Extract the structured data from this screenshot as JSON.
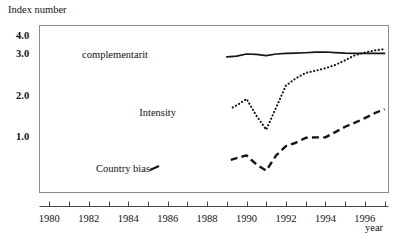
{
  "chart_data": {
    "type": "line",
    "title": "",
    "xlabel": "year",
    "ylabel": "Index number",
    "xlim": [
      1979.5,
      1997.2
    ],
    "ylim": [
      0.0,
      4.4
    ],
    "grid": false,
    "legend": "inline-annotations",
    "y_ticks": [
      "4.0",
      "3.0",
      "2.0",
      "1.0"
    ],
    "y_tick_values": [
      4.0,
      3.0,
      2.0,
      1.0
    ],
    "x_ticks": [
      "1980",
      "1982",
      "1984",
      "1986",
      "1988",
      "1990",
      "1992",
      "1994",
      "1996"
    ],
    "x_tick_values": [
      1980,
      1982,
      1984,
      1986,
      1988,
      1990,
      1992,
      1994,
      1996
    ],
    "x_minor_ticks": [
      1980,
      1981,
      1982,
      1983,
      1984,
      1985,
      1986,
      1987,
      1988,
      1989,
      1990,
      1991,
      1992,
      1993,
      1994,
      1995,
      1996,
      1997
    ],
    "series": [
      {
        "name": "complementarit",
        "style": "solid",
        "color": "#161616",
        "x": [
          1989.0,
          1989.5,
          1990.0,
          1990.5,
          1991.0,
          1991.5,
          1992.0,
          1992.5,
          1993.0,
          1993.5,
          1994.0,
          1994.5,
          1995.0,
          1995.5,
          1996.0,
          1996.5,
          1997.0
        ],
        "values": [
          2.93,
          2.95,
          3.0,
          2.99,
          2.96,
          3.0,
          3.03,
          3.05,
          3.07,
          3.1,
          3.11,
          3.08,
          3.05,
          3.04,
          3.03,
          3.03,
          3.03
        ]
      },
      {
        "name": "Intensity",
        "style": "dotted",
        "color": "#161616",
        "x": [
          1989.3,
          1989.6,
          1990.0,
          1990.5,
          1991.0,
          1991.5,
          1992.0,
          1992.5,
          1993.0,
          1993.5,
          1994.0,
          1994.5,
          1995.0,
          1995.5,
          1996.0,
          1996.5,
          1997.0
        ],
        "values": [
          1.72,
          1.8,
          1.93,
          1.52,
          1.18,
          1.72,
          2.25,
          2.42,
          2.55,
          2.6,
          2.66,
          2.74,
          2.85,
          2.97,
          3.08,
          3.2,
          3.27
        ]
      },
      {
        "name": "Country bias",
        "style": "dashed",
        "color": "#161616",
        "x": [
          1989.2,
          1989.6,
          1990.0,
          1990.5,
          1991.0,
          1991.5,
          1992.0,
          1992.5,
          1993.0,
          1993.5,
          1994.0,
          1994.5,
          1995.0,
          1995.5,
          1996.0,
          1996.5,
          1997.0
        ],
        "values": [
          0.44,
          0.5,
          0.55,
          0.33,
          0.18,
          0.55,
          0.78,
          0.86,
          0.98,
          0.99,
          0.99,
          1.12,
          1.25,
          1.35,
          1.46,
          1.58,
          1.68
        ]
      }
    ],
    "annotations": [
      {
        "name": "complementarit",
        "text": "complementarit",
        "x_px": 148,
        "y_px": 58
      },
      {
        "name": "Intensity",
        "text": "Intensity",
        "x_px": 176,
        "y_px": 116
      },
      {
        "name": "Country bias",
        "text": "Country bias",
        "x_px": 150,
        "y_px": 172
      }
    ]
  },
  "axes": {
    "y_axis_title": "Index number",
    "x_axis_title": "year"
  }
}
